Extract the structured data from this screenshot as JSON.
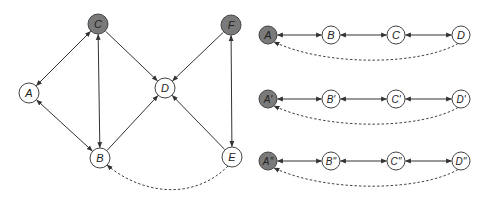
{
  "colors": {
    "observed_fill": "#7a7a7a",
    "latent_fill": "#ffffff",
    "stroke": "#444444"
  },
  "left_graph": {
    "nodes": [
      {
        "id": "A",
        "label": "A",
        "x": 29,
        "y": 93,
        "shaded": false
      },
      {
        "id": "B",
        "label": "B",
        "x": 100,
        "y": 158,
        "shaded": false
      },
      {
        "id": "C",
        "label": "C",
        "x": 98,
        "y": 24,
        "shaded": true
      },
      {
        "id": "D",
        "label": "D",
        "x": 165,
        "y": 88,
        "shaded": false
      },
      {
        "id": "E",
        "label": "E",
        "x": 232,
        "y": 157,
        "shaded": false
      },
      {
        "id": "F",
        "label": "F",
        "x": 231,
        "y": 25,
        "shaded": true
      }
    ],
    "edges": [
      {
        "from": "C",
        "to": "A",
        "type": "bidirected"
      },
      {
        "from": "A",
        "to": "B",
        "type": "bidirected"
      },
      {
        "from": "C",
        "to": "B",
        "type": "bidirected"
      },
      {
        "from": "C",
        "to": "D",
        "type": "directed"
      },
      {
        "from": "B",
        "to": "D",
        "type": "directed"
      },
      {
        "from": "F",
        "to": "D",
        "type": "directed"
      },
      {
        "from": "E",
        "to": "D",
        "type": "directed"
      },
      {
        "from": "F",
        "to": "E",
        "type": "bidirected"
      },
      {
        "from": "E",
        "to": "B",
        "type": "dashed-directed"
      }
    ]
  },
  "right_chains": [
    {
      "y": 35,
      "curve_bottom": 63,
      "nodes": [
        {
          "label": "A",
          "x": 268,
          "shaded": true
        },
        {
          "label": "B",
          "x": 331,
          "shaded": false
        },
        {
          "label": "C",
          "x": 396,
          "shaded": false
        },
        {
          "label": "D",
          "x": 461,
          "shaded": false
        }
      ]
    },
    {
      "y": 99,
      "curve_bottom": 127,
      "nodes": [
        {
          "label": "A'",
          "x": 268,
          "shaded": true
        },
        {
          "label": "B'",
          "x": 331,
          "shaded": false
        },
        {
          "label": "C'",
          "x": 396,
          "shaded": false
        },
        {
          "label": "D'",
          "x": 461,
          "shaded": false
        }
      ]
    },
    {
      "y": 161,
      "curve_bottom": 189,
      "nodes": [
        {
          "label": "A''",
          "x": 268,
          "shaded": true
        },
        {
          "label": "B''",
          "x": 331,
          "shaded": false
        },
        {
          "label": "C''",
          "x": 396,
          "shaded": false
        },
        {
          "label": "D''",
          "x": 461,
          "shaded": false
        }
      ]
    }
  ]
}
